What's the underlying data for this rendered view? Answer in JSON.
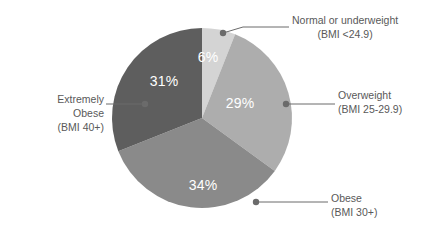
{
  "chart_data": {
    "type": "pie",
    "title": "",
    "subtitle": "",
    "legend_position": "callouts",
    "grid": false,
    "start_angle_deg": 0,
    "direction": "clockwise",
    "categories": [
      "Normal or underweight (BMI <24.9)",
      "Overweight (BMI 25-29.9)",
      "Obese (BMI 30+)",
      "Extremely Obese (BMI 40+)"
    ],
    "values": [
      6,
      29,
      34,
      31
    ],
    "value_labels": [
      "6%",
      "29%",
      "34%",
      "31%"
    ],
    "colors": [
      "#d4d4d4",
      "#adadad",
      "#8a8a8a",
      "#5e5e5e"
    ],
    "unit": "%"
  },
  "pie": {
    "center_x": 202,
    "center_y": 118,
    "radius": 90,
    "slices": [
      {
        "key": "normal",
        "name": "Normal or underweight",
        "sub": "(BMI <24.9)",
        "value": 6,
        "value_label": "6%",
        "color": "#d4d4d4",
        "label_x": 208,
        "label_y": 62
      },
      {
        "key": "overweight",
        "name": "Overweight",
        "sub": "(BMI 25-29.9)",
        "value": 29,
        "value_label": "29%",
        "color": "#adadad",
        "label_x": 240,
        "label_y": 108
      },
      {
        "key": "obese",
        "name": "Obese",
        "sub": "(BMI 30+)",
        "value": 34,
        "value_label": "34%",
        "color": "#8a8a8a",
        "label_x": 203,
        "label_y": 190
      },
      {
        "key": "extreme",
        "name": "Extremely Obese",
        "sub": "(BMI 40+)",
        "value": 31,
        "value_label": "31%",
        "color": "#5e5e5e",
        "label_x": 164,
        "label_y": 86
      }
    ]
  },
  "callouts": {
    "normal": {
      "line1": "Normal or underweight",
      "line2": "(BMI <24.9)"
    },
    "overweight": {
      "line1": "Overweight",
      "line2": "(BMI 25-29.9)"
    },
    "obese": {
      "line1": "Obese",
      "line2": "(BMI 30+)"
    },
    "extreme": {
      "line1": "Extremely",
      "line2": "Obese",
      "line3": "(BMI 40+)"
    }
  },
  "style": {
    "leader_color": "#6b6b6b",
    "text_color": "#595959",
    "value_text_color": "#ffffff",
    "background": "#ffffff"
  }
}
